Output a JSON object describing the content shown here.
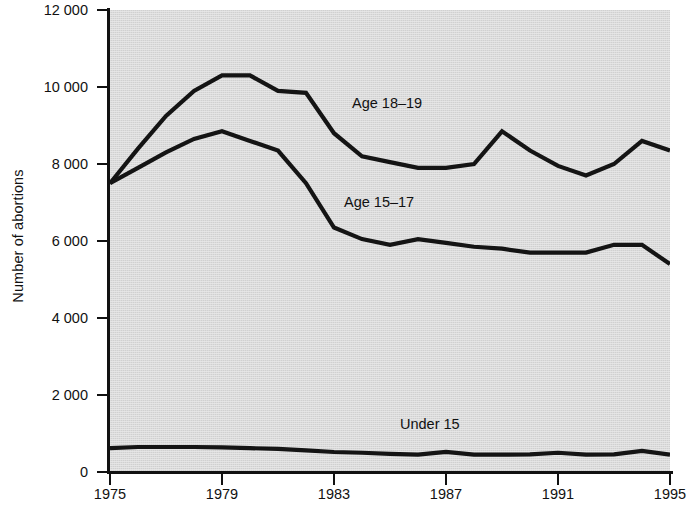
{
  "chart_data": {
    "type": "line",
    "title": "",
    "xlabel": "",
    "ylabel": "Number of abortions",
    "xlim": [
      1975,
      1995
    ],
    "ylim": [
      0,
      12000
    ],
    "grid": false,
    "legend_position": "inline-annotations",
    "x": [
      1975,
      1976,
      1977,
      1978,
      1979,
      1980,
      1981,
      1982,
      1983,
      1984,
      1985,
      1986,
      1987,
      1988,
      1989,
      1990,
      1991,
      1992,
      1993,
      1994,
      1995
    ],
    "x_tick_labels": [
      "1975",
      "1979",
      "1983",
      "1987",
      "1991",
      "1995"
    ],
    "x_ticks": [
      1975,
      1979,
      1983,
      1987,
      1991,
      1995
    ],
    "y_ticks": [
      0,
      2000,
      4000,
      6000,
      8000,
      10000,
      12000
    ],
    "y_tick_labels": [
      "0",
      "2 000",
      "4 000",
      "6 000",
      "8 000",
      "10 000",
      "12 000"
    ],
    "series": [
      {
        "name": "Age 18-19",
        "label": "Age 18–19",
        "color": "#141414",
        "values": [
          7500,
          8400,
          9250,
          9900,
          10300,
          10300,
          9900,
          9850,
          8800,
          8200,
          8050,
          7900,
          7900,
          8000,
          8850,
          8350,
          7950,
          7700,
          8000,
          8600,
          8350
        ]
      },
      {
        "name": "Age 15-17",
        "label": "Age 15–17",
        "color": "#141414",
        "values": [
          7500,
          7900,
          8300,
          8650,
          8850,
          8600,
          8350,
          7500,
          6350,
          6050,
          5900,
          6050,
          5950,
          5850,
          5800,
          5700,
          5700,
          5700,
          5900,
          5900,
          5400
        ]
      },
      {
        "name": "Under 15",
        "label": "Under 15",
        "color": "#141414",
        "values": [
          620,
          650,
          650,
          650,
          640,
          620,
          600,
          560,
          520,
          500,
          470,
          450,
          520,
          450,
          450,
          460,
          500,
          450,
          460,
          550,
          450
        ]
      }
    ],
    "annotations": [
      {
        "text": "Age 18–19",
        "x_px": 352,
        "y_px": 95
      },
      {
        "text": "Age 15–17",
        "x_px": 344,
        "y_px": 194
      },
      {
        "text": "Under 15",
        "x_px": 400,
        "y_px": 416
      }
    ]
  },
  "axes": {
    "y_title": "Number of abortions",
    "y_labels": [
      "12 000",
      "10 000",
      "8 000",
      "6 000",
      "4 000",
      "2 000",
      "0"
    ],
    "x_labels": [
      "1975",
      "1979",
      "1983",
      "1987",
      "1991",
      "1995"
    ]
  },
  "style": {
    "plot_background": "#e9e9e9",
    "band_color": "#dcdcdc",
    "line_color": "#141414",
    "axis_color": "#111111",
    "text_color": "#111111"
  }
}
